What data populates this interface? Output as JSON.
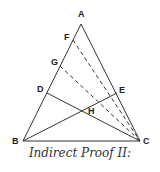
{
  "diagram": {
    "caption": "Indirect Proof II:",
    "stroke_color": "#333333",
    "points": {
      "A": {
        "label": "A",
        "x": 81,
        "y": 24
      },
      "B": {
        "label": "B",
        "x": 23,
        "y": 141
      },
      "C": {
        "label": "C",
        "x": 140,
        "y": 141
      },
      "D": {
        "label": "D",
        "x": 47,
        "y": 93
      },
      "E": {
        "label": "E",
        "x": 117,
        "y": 93
      },
      "F": {
        "label": "F",
        "x": 73,
        "y": 40
      },
      "G": {
        "label": "G",
        "x": 60,
        "y": 66
      },
      "H": {
        "label": "H",
        "x": 82,
        "y": 110
      }
    },
    "solid_segments": [
      [
        "A",
        "B"
      ],
      [
        "A",
        "C"
      ],
      [
        "B",
        "C"
      ],
      [
        "B",
        "E"
      ],
      [
        "D",
        "C"
      ]
    ],
    "dashed_segments": [
      [
        "F",
        "C"
      ],
      [
        "G",
        "C"
      ]
    ]
  }
}
